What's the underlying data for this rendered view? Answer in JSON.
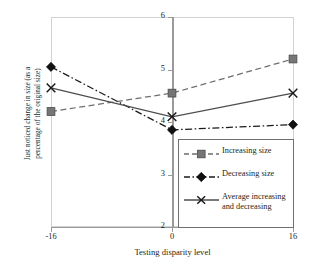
{
  "chart_data": {
    "type": "line",
    "title": "",
    "xlabel": "Testing disparity level",
    "ylabel": "Just noticed change in size (as a percentage of the original size)",
    "ylabel_lines": [
      "Just noticed change in size (as a",
      "percentage of the original size)"
    ],
    "x": [
      -16,
      0,
      16
    ],
    "categories": [
      "-16",
      "0",
      "16"
    ],
    "xticklabels": [
      "-16",
      "0",
      "16"
    ],
    "yticklabels": [
      "6",
      "5",
      "4",
      "3",
      "2"
    ],
    "ylim": [
      2,
      6
    ],
    "xlim": [
      -16,
      16
    ],
    "grid": false,
    "legend_position": "inside-bottom-right",
    "series": [
      {
        "name": "Increasing size",
        "values": [
          4.2,
          4.55,
          5.2
        ],
        "marker": "square",
        "linestyle": "dashed",
        "color": "#6e6e6e"
      },
      {
        "name": "Decreasing size",
        "values": [
          5.05,
          3.85,
          3.95
        ],
        "marker": "diamond",
        "linestyle": "dashdot",
        "color": "#1a1a1a"
      },
      {
        "name": "Average increasing and decreasing",
        "name_lines": [
          "Average increasing",
          "and decreasing"
        ],
        "values": [
          4.65,
          4.1,
          4.55
        ],
        "marker": "x",
        "linestyle": "solid",
        "color": "#4d4d4d"
      }
    ]
  },
  "legend": {
    "items": [
      {
        "label": "Increasing size"
      },
      {
        "label": "Decreasing size"
      },
      {
        "label_line1": "Average increasing",
        "label_line2": "and decreasing"
      }
    ]
  },
  "axes": {
    "y_ticks": [
      "6",
      "5",
      "4",
      "3",
      "2"
    ],
    "x_ticks": [
      "-16",
      "0",
      "16"
    ],
    "x_title": "Testing disparity level",
    "y_title_line1": "Just noticed change in size (as a",
    "y_title_line2": "percentage of the original size)"
  },
  "colors": {
    "increasing": "#6e6e6e",
    "decreasing": "#1a1a1a",
    "average": "#4d4d4d",
    "axis": "#9a9a9a",
    "frame": "#d2d2d2",
    "text": "#231f20"
  }
}
